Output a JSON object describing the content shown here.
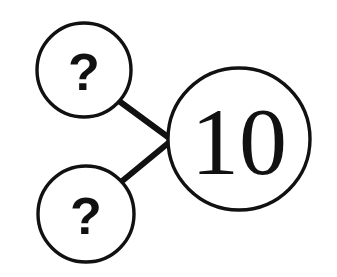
{
  "canvas": {
    "width": 337,
    "height": 277,
    "background": "#ffffff",
    "ink_color": "#111111"
  },
  "diagram": {
    "type": "number-bond",
    "stroke_color": "#111111",
    "circle_stroke_width": 3.4,
    "connector_stroke_width": 6,
    "junction": {
      "x": 172,
      "y": 140
    },
    "nodes": [
      {
        "id": "part-top",
        "role": "part",
        "label": "?",
        "cx": 84,
        "cy": 70,
        "r": 47,
        "font_size": 52,
        "label_dx": 0,
        "label_dy": 2
      },
      {
        "id": "part-bottom",
        "role": "part",
        "label": "?",
        "cx": 86,
        "cy": 214,
        "r": 48,
        "font_size": 52,
        "label_dx": 0,
        "label_dy": 2
      },
      {
        "id": "whole",
        "role": "whole",
        "label": "10",
        "cx": 239,
        "cy": 139,
        "r": 71,
        "font_size": 96,
        "label_dx": 0,
        "label_dy": 2
      }
    ],
    "connectors": [
      {
        "id": "connector-top",
        "from": "part-top",
        "to": "whole",
        "x1": 119,
        "y1": 101,
        "x2": 172,
        "y2": 140
      },
      {
        "id": "connector-bottom",
        "from": "part-bottom",
        "to": "whole",
        "x1": 121,
        "y1": 182,
        "x2": 172,
        "y2": 140
      }
    ]
  }
}
